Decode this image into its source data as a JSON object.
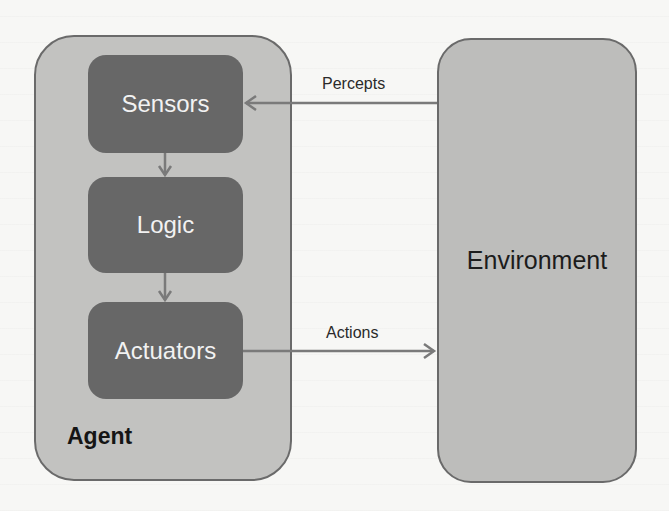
{
  "diagram": {
    "agent": {
      "label": "Agent",
      "components": [
        {
          "label": "Sensors"
        },
        {
          "label": "Logic"
        },
        {
          "label": "Actuators"
        }
      ]
    },
    "environment": {
      "label": "Environment"
    },
    "edges": [
      {
        "from": "Environment",
        "to": "Sensors",
        "label": "Percepts"
      },
      {
        "from": "Sensors",
        "to": "Logic",
        "label": ""
      },
      {
        "from": "Logic",
        "to": "Actuators",
        "label": ""
      },
      {
        "from": "Actuators",
        "to": "Environment",
        "label": "Actions"
      }
    ],
    "colors": {
      "agent_fill": "#c2c2c0",
      "component_fill": "#676767",
      "environment_fill": "#bdbdbb",
      "arrow": "#7a7a7a",
      "border": "#6a6a6a"
    }
  }
}
